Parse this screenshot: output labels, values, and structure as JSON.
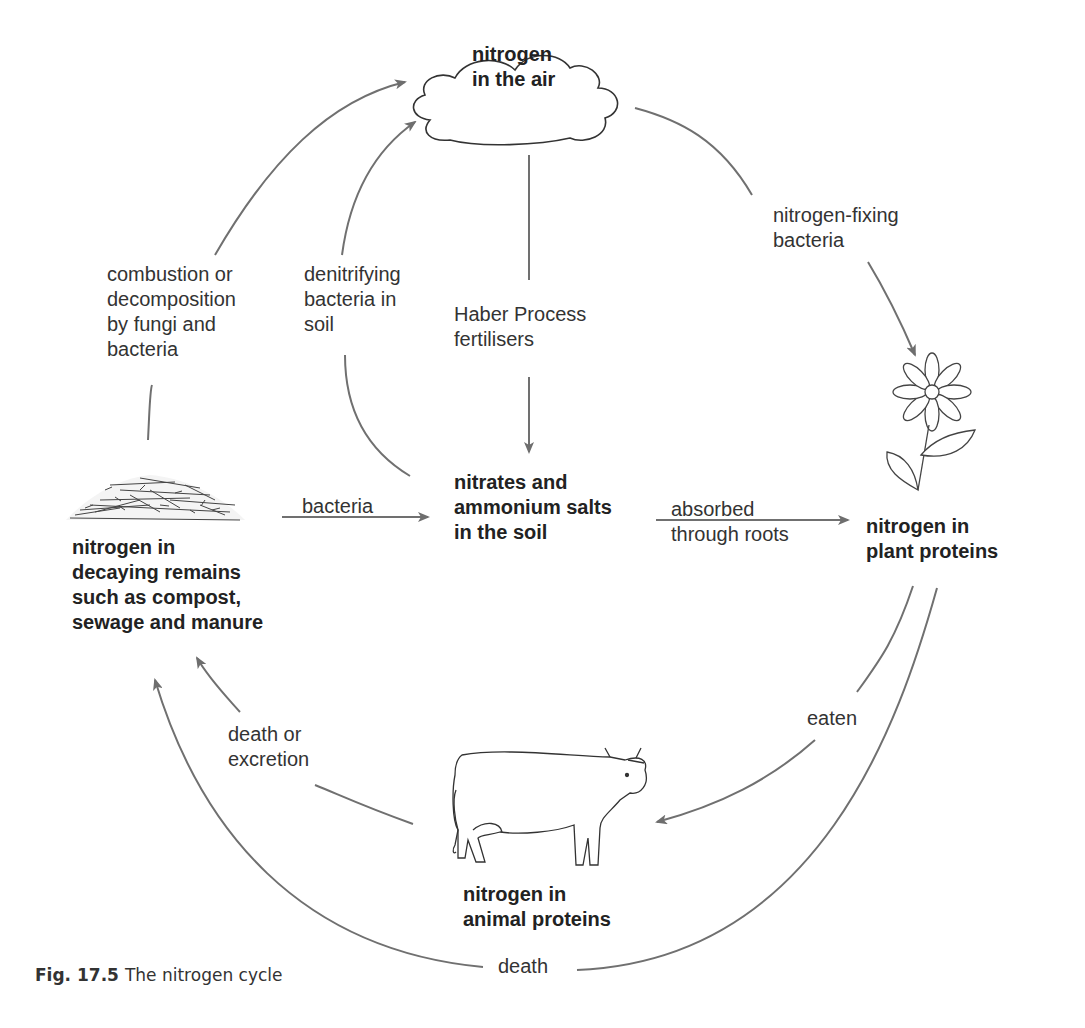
{
  "figure": {
    "number": "Fig. 17.5",
    "title": "The nitrogen cycle"
  },
  "nodes": {
    "air": "nitrogen\nin the air",
    "soil": "nitrates and\nammonium salts\nin the soil",
    "plant": "nitrogen in\nplant proteins",
    "animal": "nitrogen in\nanimal proteins",
    "decay": "nitrogen in\ndecaying remains\nsuch as compost,\nsewage and manure"
  },
  "processes": {
    "combustion": "combustion or\ndecomposition\nby fungi and\nbacteria",
    "denitrifying": "denitrifying\nbacteria in\nsoil",
    "haber": "Haber Process\nfertilisers",
    "fixing": "nitrogen-fixing\nbacteria",
    "bacteria": "bacteria",
    "absorbed": "absorbed\nthrough roots",
    "eaten": "eaten",
    "death_excretion": "death or\nexcretion",
    "death": "death"
  },
  "icons": {
    "air": "cloud-icon",
    "plant": "flower-icon",
    "animal": "cow-icon",
    "decay": "compost-pile-icon"
  },
  "colors": {
    "arrow": "#707070",
    "outline": "#333333",
    "text": "#222222"
  }
}
